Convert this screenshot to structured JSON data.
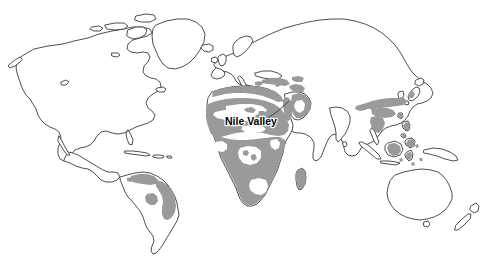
{
  "figure": {
    "type": "world-map",
    "projection": "equirectangular-world-outline",
    "width": 495,
    "height": 260,
    "background_color": "#ffffff",
    "land_fill_color": "#ffffff",
    "land_outline_color": "#3c3c3c",
    "shaded_region_color": "#9a9a9a",
    "label_text_color": "#000000"
  },
  "annotations": {
    "callouts": [
      {
        "id": "nile-valley",
        "label": "Nile Valley",
        "label_x": 225,
        "label_y": 125,
        "leader_from_x": 271,
        "leader_from_y": 118,
        "leader_to_x": 289,
        "leader_to_y": 101
      }
    ]
  },
  "shaded_regions": [
    {
      "name": "north-south-america-amazon-brazil",
      "continent": "South America"
    },
    {
      "name": "sahel-north-africa",
      "continent": "Africa"
    },
    {
      "name": "sub-saharan-africa",
      "continent": "Africa"
    },
    {
      "name": "madagascar",
      "continent": "Africa"
    },
    {
      "name": "arabian-peninsula-middle-east",
      "continent": "Asia"
    },
    {
      "name": "mediterranean-north-africa-coast",
      "continent": "Africa"
    },
    {
      "name": "eastern-china-korea",
      "continent": "Asia"
    },
    {
      "name": "southeast-asia-indochina",
      "continent": "Asia"
    },
    {
      "name": "maritime-southeast-asia",
      "continent": "Asia"
    }
  ],
  "landmasses": [
    {
      "name": "north-america"
    },
    {
      "name": "greenland"
    },
    {
      "name": "iceland"
    },
    {
      "name": "south-america"
    },
    {
      "name": "eurasia"
    },
    {
      "name": "africa"
    },
    {
      "name": "madagascar"
    },
    {
      "name": "japan"
    },
    {
      "name": "philippines"
    },
    {
      "name": "indonesia"
    },
    {
      "name": "australia"
    },
    {
      "name": "new-zealand"
    },
    {
      "name": "british-isles"
    },
    {
      "name": "sri-lanka"
    },
    {
      "name": "cuba-caribbean"
    },
    {
      "name": "arctic-islands"
    }
  ]
}
